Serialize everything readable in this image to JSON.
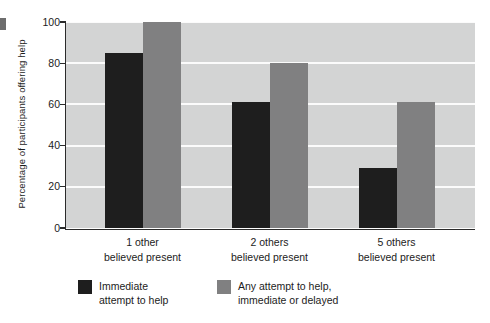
{
  "chart_data": {
    "type": "bar",
    "title": "",
    "subtitle": "",
    "xlabel": "",
    "ylabel": "Percentage of participants offering help",
    "ylim": [
      0,
      100
    ],
    "yticks": [
      0,
      20,
      40,
      60,
      80,
      100
    ],
    "ytick_labels": [
      "0",
      "20",
      "40",
      "60",
      "80",
      "100"
    ],
    "grid": "horizontal",
    "legend_position": "below-left",
    "categories": [
      {
        "line1": "1 other",
        "line2": "believed present"
      },
      {
        "line1": "2 others",
        "line2": "believed present"
      },
      {
        "line1": "5 others",
        "line2": "believed present"
      }
    ],
    "category_labels": [
      "1 other believed present",
      "2 others believed present",
      "5 others believed present"
    ],
    "series": [
      {
        "name": "Immediate attempt to help",
        "legend_line1": "Immediate",
        "legend_line2": "attempt to help",
        "color": "#1e1e1e",
        "values": [
          85,
          61,
          29
        ]
      },
      {
        "name": "Any attempt to help, immediate or delayed",
        "legend_line1": "Any attempt to help,",
        "legend_line2": "immediate or delayed",
        "color": "#808081",
        "values": [
          100,
          80,
          61
        ]
      }
    ],
    "plot_background": "#d3d4d4",
    "gridline_color": "#fbfbfb",
    "axis_color": "#2b2b2b"
  }
}
